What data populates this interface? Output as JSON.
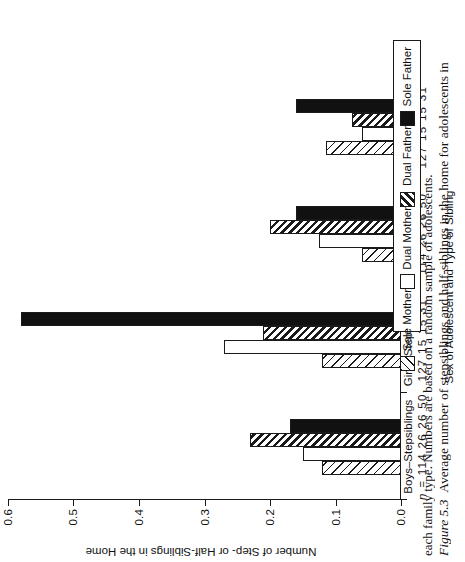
{
  "figure": {
    "number": "Figure 5.3",
    "caption_line1": "Average number of stepsiblings and half-siblings in the home for adolescents in",
    "caption_line2": "each family type. Numbers are based on a random sample of adolescents."
  },
  "chart_data": {
    "type": "bar",
    "title": "",
    "xlabel": "Sex of Adolescent and Type of Sibling",
    "ylabel": "Number of Step- or Half-Siblings in the Home",
    "ylim": [
      0.0,
      0.6
    ],
    "yticks": [
      "0.0",
      "0.1",
      "0.2",
      "0.3",
      "0.4",
      "0.5",
      "0.6"
    ],
    "ytick_values": [
      0.0,
      0.1,
      0.2,
      0.3,
      0.4,
      0.5,
      0.6
    ],
    "grid": false,
    "legend_position": "right",
    "categories": [
      "Boys–Stepsiblings",
      "Girls–Stepsiblings",
      "Boys–Half siblings",
      "Girls–Half siblings"
    ],
    "category_n_prefix": "n = ",
    "category_n": [
      "114  26  26  50",
      "127  15  15  31",
      "114  26  26  50",
      "127  15  15  31"
    ],
    "series": [
      {
        "name": "Sole Mother",
        "fill": "hatch-light-diagonal",
        "values": [
          0.12,
          0.12,
          0.06,
          0.115
        ]
      },
      {
        "name": "Dual Mother",
        "fill": "white",
        "values": [
          0.15,
          0.27,
          0.125,
          0.06
        ]
      },
      {
        "name": "Dual Father",
        "fill": "hatch-dense-diagonal",
        "values": [
          0.23,
          0.21,
          0.2,
          0.075
        ]
      },
      {
        "name": "Sole Father",
        "fill": "solid-black",
        "values": [
          0.17,
          0.58,
          0.16,
          0.16
        ]
      }
    ]
  },
  "colors": {
    "ink": "#1a1a1a",
    "paper": "#ffffff",
    "solid_fill": "#111111"
  }
}
